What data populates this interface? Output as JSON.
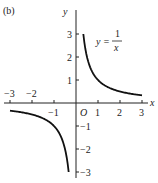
{
  "panel_label": "(b)",
  "chart_data": {
    "type": "line",
    "title": "",
    "equation": {
      "lhs": "y =",
      "numerator": "1",
      "denominator": "x"
    },
    "xlabel": "x",
    "ylabel": "y",
    "origin_label": "O",
    "xlim": [
      -3,
      3
    ],
    "ylim": [
      -3,
      3
    ],
    "x_ticks": [
      -3,
      -2,
      -1,
      1,
      2,
      3
    ],
    "x_tick_labels": [
      "−3",
      "−2",
      "−1",
      "1",
      "2",
      "3"
    ],
    "y_ticks": [
      -3,
      -2,
      -1,
      1,
      2,
      3
    ],
    "y_tick_labels": [
      "−3",
      "−2",
      "−1",
      "1",
      "2",
      "3"
    ],
    "grid": false,
    "series": [
      {
        "name": "y = 1/x (x > 0)",
        "x": [
          0.333,
          0.5,
          1,
          1.5,
          2,
          2.5,
          3
        ],
        "y": [
          3,
          2,
          1,
          0.667,
          0.5,
          0.4,
          0.333
        ]
      },
      {
        "name": "y = 1/x (x < 0)",
        "x": [
          -3,
          -2.5,
          -2,
          -1.5,
          -1,
          -0.5,
          -0.333
        ],
        "y": [
          -0.333,
          -0.4,
          -0.5,
          -0.667,
          -1,
          -2,
          -3
        ]
      }
    ]
  }
}
